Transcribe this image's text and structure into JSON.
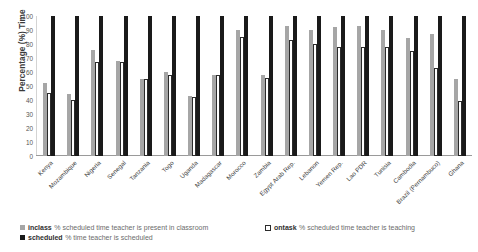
{
  "chart_data": {
    "type": "bar",
    "title": "",
    "subtitle": "",
    "xlabel": "",
    "ylabel": "Percentage (%) Time",
    "ylim": [
      0,
      100
    ],
    "yticks": [
      100,
      90,
      80,
      70,
      60,
      50,
      40,
      30,
      20,
      10,
      0
    ],
    "grid": false,
    "legend_position": "bottom",
    "categories": [
      "Kenya",
      "Mozambique",
      "Nigeria",
      "Senegal",
      "Tanzania",
      "Togo",
      "Uganda",
      "Madagascar",
      "Morocco",
      "Zambia",
      "Egypt Arab Rep.",
      "Lebanon",
      "Yemen Rep.",
      "Lao PDR",
      "Tunisia",
      "Cambodia",
      "Brazil (Pernambuco)",
      "Ghana"
    ],
    "series": [
      {
        "name": "inclass",
        "color": "#a6a6a6",
        "values": [
          52,
          44,
          76,
          68,
          55,
          60,
          43,
          58,
          90,
          58,
          93,
          90,
          92,
          93,
          90,
          84,
          87,
          55
        ]
      },
      {
        "name": "ontask",
        "color": "#ffffff",
        "values": [
          45,
          40,
          67,
          67,
          55,
          58,
          42,
          58,
          85,
          56,
          83,
          80,
          78,
          78,
          78,
          75,
          63,
          39
        ]
      },
      {
        "name": "scheduled",
        "color": "#1a1a1a",
        "values": [
          100,
          100,
          100,
          100,
          100,
          100,
          100,
          100,
          100,
          100,
          100,
          100,
          100,
          100,
          100,
          100,
          100,
          100
        ]
      }
    ]
  },
  "axis": {
    "y_title": "Percentage (%) Time"
  },
  "legend": {
    "items": [
      {
        "key": "inclass",
        "description": "% scheduled time teacher is present in classroom",
        "swatch": "filled-gray"
      },
      {
        "key": "ontask",
        "description": "% scheduled time teacher is teaching",
        "swatch": "outlined-white"
      },
      {
        "key": "scheduled",
        "description": "% time teacher is scheduled",
        "swatch": "filled-black"
      }
    ]
  }
}
